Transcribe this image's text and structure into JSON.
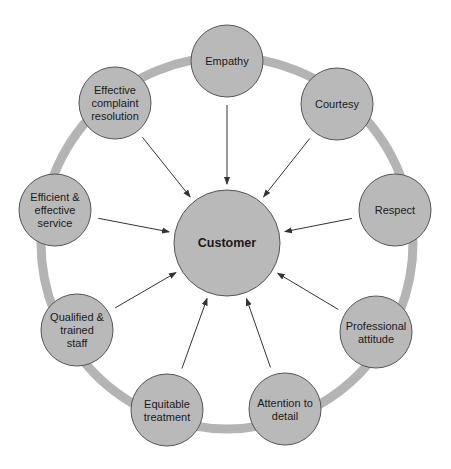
{
  "diagram": {
    "type": "hub-and-spoke",
    "colors": {
      "background": "#ffffff",
      "node_fill": "#b9b9b9",
      "node_stroke": "#555555",
      "ring": "#b4b4b4",
      "arrow": "#333333",
      "text": "#1a1a1a"
    },
    "ring": {
      "cx": 227,
      "cy": 243,
      "r": 186,
      "width": 9
    },
    "center": {
      "label": "Customer",
      "cx": 227,
      "cy": 243,
      "r": 53
    },
    "nodes": [
      {
        "id": "empathy",
        "lines": [
          "Empathy"
        ],
        "cx": 227,
        "cy": 61
      },
      {
        "id": "courtesy",
        "lines": [
          "Courtesy"
        ],
        "cx": 337,
        "cy": 104
      },
      {
        "id": "respect",
        "lines": [
          "Respect"
        ],
        "cx": 395,
        "cy": 210
      },
      {
        "id": "professional-attitude",
        "lines": [
          "Professional",
          "attitude"
        ],
        "cx": 376,
        "cy": 332
      },
      {
        "id": "attention-to-detail",
        "lines": [
          "Attention to",
          "detail"
        ],
        "cx": 285,
        "cy": 409
      },
      {
        "id": "equitable-treatment",
        "lines": [
          "Equitable",
          "treatment"
        ],
        "cx": 167,
        "cy": 410
      },
      {
        "id": "qualified-trained-staff",
        "lines": [
          "Qualified &",
          "trained",
          "staff"
        ],
        "cx": 77,
        "cy": 330
      },
      {
        "id": "efficient-effective-service",
        "lines": [
          "Efficient &",
          "effective",
          "service"
        ],
        "cx": 55,
        "cy": 210
      },
      {
        "id": "effective-complaint-resolution",
        "lines": [
          "Effective",
          "complaint",
          "resolution"
        ],
        "cx": 115,
        "cy": 103
      }
    ],
    "node_radius": 36
  }
}
